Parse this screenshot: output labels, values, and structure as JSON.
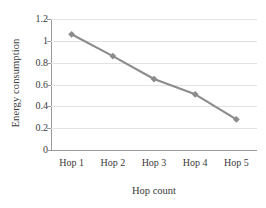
{
  "chart_data": {
    "type": "line",
    "title": "",
    "subtitle": "",
    "xlabel": "Hop count",
    "ylabel": "Energy consumption",
    "categories": [
      "Hop 1",
      "Hop 2",
      "Hop 3",
      "Hop 4",
      "Hop 5"
    ],
    "values": [
      1.06,
      0.86,
      0.65,
      0.51,
      0.28
    ],
    "series": [
      {
        "name": "Energy consumption",
        "values": [
          1.06,
          0.86,
          0.65,
          0.51,
          0.28
        ]
      }
    ],
    "ylim": [
      0,
      1.2
    ],
    "y_ticks": [
      0,
      0.2,
      0.4,
      0.6,
      0.8,
      1,
      1.2
    ],
    "y_tick_labels": [
      "0",
      "0.2",
      "0.4",
      "0.6",
      "0.8",
      "1",
      "1.2"
    ],
    "grid": "horizontal",
    "legend": "none",
    "marker": "diamond",
    "colors": {
      "series_line": "#8c8c8c",
      "marker": "#8c8c8c",
      "gridline": "#e2e2e2",
      "axis": "#9a9a9a",
      "text": "#3a3a3a",
      "background": "#ffffff"
    }
  }
}
